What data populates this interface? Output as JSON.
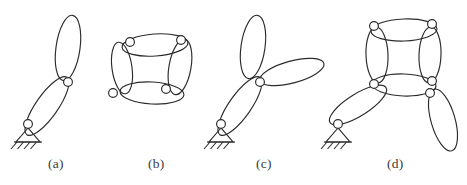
{
  "figure": {
    "width": 467,
    "height": 185,
    "background": "#ffffff",
    "stroke_color": "#2b2b2b",
    "joint_fill": "#ffffff",
    "caption_color": "#3a3a3a"
  },
  "captions": [
    {
      "label": "(a)",
      "x": 48,
      "y": 156
    },
    {
      "label": "(b)",
      "x": 148,
      "y": 156
    },
    {
      "label": "(c)",
      "x": 256,
      "y": 156
    },
    {
      "label": "(d)",
      "x": 387,
      "y": 156
    }
  ],
  "diagrams": [
    {
      "id": "diagram-a",
      "label": "(a)",
      "description": "Two-link serial chain grounded at lower left",
      "links": [
        {
          "name": "link-lower",
          "cx": 47,
          "cy": 106,
          "rx": 11,
          "ry": 35,
          "rotation": 35
        },
        {
          "name": "link-upper",
          "cx": 68,
          "cy": 48,
          "rx": 12,
          "ry": 33,
          "rotation": 8
        }
      ],
      "joints": [
        {
          "name": "joint-ground",
          "cx": 28,
          "cy": 124,
          "r": 4.4
        },
        {
          "name": "joint-middle",
          "cx": 68,
          "cy": 82,
          "r": 4.4
        }
      ],
      "ground": {
        "name": "ground-support",
        "x": 28,
        "y": 128,
        "width": 24,
        "height": 14,
        "hatch_count": 4
      }
    },
    {
      "id": "diagram-b",
      "label": "(b)",
      "description": "Closed four-bar loop with four ellipse links",
      "links": [
        {
          "name": "link-top",
          "cx": 155,
          "cy": 45,
          "rx": 33,
          "ry": 11,
          "rotation": -4
        },
        {
          "name": "link-right",
          "cx": 180,
          "cy": 67,
          "rx": 11,
          "ry": 28,
          "rotation": 10
        },
        {
          "name": "link-bottom",
          "cx": 152,
          "cy": 93,
          "rx": 32,
          "ry": 11,
          "rotation": 3
        },
        {
          "name": "link-left",
          "cx": 122,
          "cy": 68,
          "rx": 10,
          "ry": 26,
          "rotation": -8
        }
      ],
      "joints": [
        {
          "name": "joint-top-left",
          "cx": 130,
          "cy": 42,
          "r": 4.4
        },
        {
          "name": "joint-top-right",
          "cx": 181,
          "cy": 40,
          "r": 4.4
        },
        {
          "name": "joint-bottom-right",
          "cx": 166,
          "cy": 89,
          "r": 4.4
        },
        {
          "name": "joint-bottom-left",
          "cx": 113,
          "cy": 93,
          "r": 4.4
        }
      ],
      "ground": null
    },
    {
      "id": "diagram-c",
      "label": "(c)",
      "description": "Three ellipse links meeting at a common ternary joint, grounded at lower left",
      "links": [
        {
          "name": "link-lower",
          "cx": 240,
          "cy": 106,
          "rx": 11,
          "ry": 35,
          "rotation": 35
        },
        {
          "name": "link-upper-vertical",
          "cx": 253,
          "cy": 47,
          "rx": 12,
          "ry": 32,
          "rotation": 8
        },
        {
          "name": "link-upper-right",
          "cx": 292,
          "cy": 72,
          "rx": 33,
          "ry": 11,
          "rotation": -15
        }
      ],
      "joints": [
        {
          "name": "joint-ground",
          "cx": 221,
          "cy": 124,
          "r": 4.4
        },
        {
          "name": "joint-ternary",
          "cx": 260,
          "cy": 82,
          "r": 4.4
        }
      ],
      "ground": {
        "name": "ground-support",
        "x": 221,
        "y": 128,
        "width": 24,
        "height": 14,
        "hatch_count": 4
      }
    },
    {
      "id": "diagram-d",
      "label": "(d)",
      "description": "Four-bar loop with an input link grounded at lower left and an output link hanging lower right",
      "links": [
        {
          "name": "link-loop-top",
          "cx": 404,
          "cy": 30,
          "rx": 33,
          "ry": 11,
          "rotation": -2
        },
        {
          "name": "link-loop-right",
          "cx": 430,
          "cy": 55,
          "rx": 11,
          "ry": 28,
          "rotation": 2
        },
        {
          "name": "link-loop-bottom",
          "cx": 404,
          "cy": 85,
          "rx": 32,
          "ry": 11,
          "rotation": 2
        },
        {
          "name": "link-loop-left",
          "cx": 377,
          "cy": 55,
          "rx": 11,
          "ry": 28,
          "rotation": -2
        },
        {
          "name": "link-input",
          "cx": 358,
          "cy": 105,
          "rx": 11,
          "ry": 33,
          "rotation": 58
        },
        {
          "name": "link-output",
          "cx": 443,
          "cy": 120,
          "rx": 12,
          "ry": 32,
          "rotation": -16
        }
      ],
      "joints": [
        {
          "name": "joint-loop-top-left",
          "cx": 374,
          "cy": 26,
          "r": 4.4
        },
        {
          "name": "joint-loop-top-right",
          "cx": 432,
          "cy": 24,
          "r": 4.4
        },
        {
          "name": "joint-loop-bottom-left",
          "cx": 374,
          "cy": 84,
          "r": 4.4
        },
        {
          "name": "joint-loop-bottom-right",
          "cx": 432,
          "cy": 81,
          "r": 4.4
        },
        {
          "name": "joint-output",
          "cx": 430,
          "cy": 93,
          "r": 4.4
        },
        {
          "name": "joint-ground",
          "cx": 338,
          "cy": 124,
          "r": 4.4
        }
      ],
      "ground": {
        "name": "ground-support",
        "x": 338,
        "y": 128,
        "width": 24,
        "height": 14,
        "hatch_count": 4
      }
    }
  ]
}
